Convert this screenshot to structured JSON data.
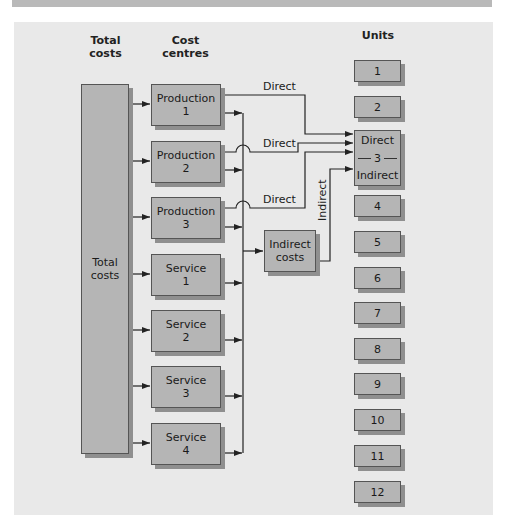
{
  "headers": {
    "total_costs": "Total\ncosts",
    "total_costs_line1": "Total",
    "total_costs_line2": "costs",
    "cost_centres_line1": "Cost",
    "cost_centres_line2": "centres",
    "units": "Units"
  },
  "total_costs_box": {
    "line1": "Total",
    "line2": "costs"
  },
  "cost_centres": [
    {
      "line1": "Production",
      "line2": "1"
    },
    {
      "line1": "Production",
      "line2": "2"
    },
    {
      "line1": "Production",
      "line2": "3"
    },
    {
      "line1": "Service",
      "line2": "1"
    },
    {
      "line1": "Service",
      "line2": "2"
    },
    {
      "line1": "Service",
      "line2": "3"
    },
    {
      "line1": "Service",
      "line2": "4"
    }
  ],
  "indirect_costs_box": {
    "line1": "Indirect",
    "line2": "costs"
  },
  "units": [
    "1",
    "2",
    "3",
    "4",
    "5",
    "6",
    "7",
    "8",
    "9",
    "10",
    "11",
    "12"
  ],
  "unit3": {
    "top": "Direct",
    "number": "3",
    "bottom": "Indirect"
  },
  "flow_labels": {
    "direct1": "Direct",
    "direct2": "Direct",
    "direct3": "Direct",
    "indirect": "Indirect"
  },
  "colors": {
    "panel_bg": "#e9e9e9",
    "box_fill": "#b5b5b5",
    "box_shadow": "#8f8f8f",
    "line": "#222222"
  }
}
